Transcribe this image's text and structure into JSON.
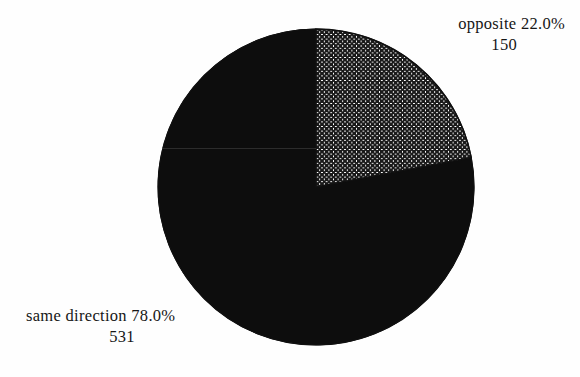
{
  "chart_data": {
    "type": "pie",
    "title": "",
    "subtitle": "",
    "xlabel": "",
    "ylabel": "",
    "legend_position": "none",
    "grid": false,
    "total": 681,
    "start_angle_deg": 90,
    "direction": "clockwise",
    "categories": [
      "opposite",
      "same direction"
    ],
    "values": [
      150,
      531
    ],
    "percentages": [
      22.0,
      78.0
    ],
    "slices": [
      {
        "label": "opposite",
        "percent_text": "22.0%",
        "percent": 22.0,
        "count_text": "150",
        "count": 150,
        "fill_style": "crosshatch",
        "fill_color": "#ffffff",
        "pattern_color": "#1a1a1a",
        "label_position": "top-right",
        "sweep_deg": 79.2
      },
      {
        "label": "same direction",
        "percent_text": "78.0%",
        "percent": 78.0,
        "count_text": "531",
        "count": 531,
        "fill_style": "solid",
        "fill_color": "#0d0d0d",
        "pattern_color": "#0d0d0d",
        "label_position": "bottom-left",
        "sweep_deg": 280.8
      }
    ]
  },
  "labels": {
    "opposite": {
      "name_and_percent": "opposite 22.0%",
      "count": "150"
    },
    "same_direction": {
      "name_and_percent": "same direction 78.0%",
      "count": "531"
    }
  },
  "geometry": {
    "center_x": 316,
    "center_y": 187,
    "radius": 158
  },
  "colors": {
    "background": "#fefefe",
    "outline": "#111111",
    "solid_slice": "#0d0d0d",
    "hatch_slice_bg": "#ffffff",
    "hatch_lines": "#1a1a1a",
    "text": "#161616"
  }
}
